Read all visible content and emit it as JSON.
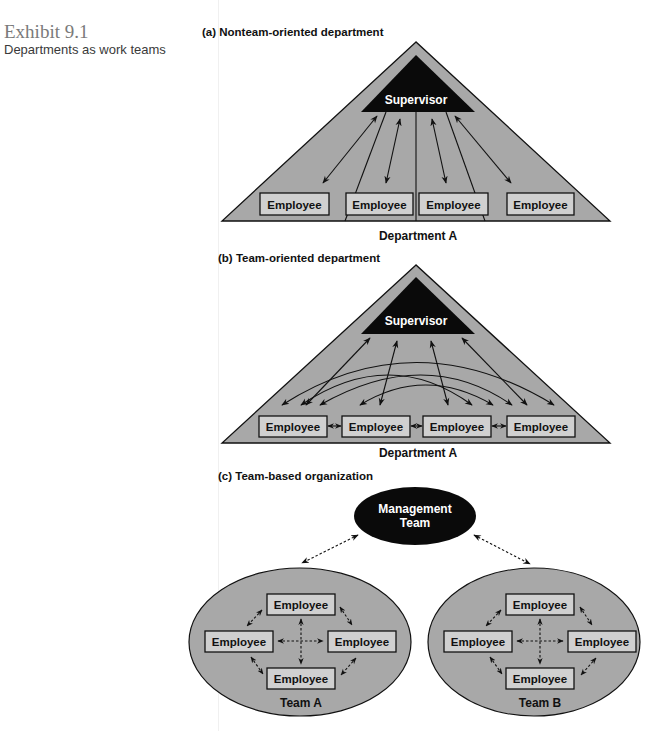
{
  "caption": {
    "exhibit_number": "Exhibit 9.1",
    "title": "Departments as work teams"
  },
  "colors": {
    "fill_gray": "#a8a8a8",
    "box_fill": "#d0d0d0",
    "dark": "#0a0a0a",
    "text": "#111111"
  },
  "panel_a": {
    "heading": "(a) Nonteam-oriented department",
    "supervisor": "Supervisor",
    "employees": [
      "Employee",
      "Employee",
      "Employee",
      "Employee"
    ],
    "department_label": "Department A"
  },
  "panel_b": {
    "heading": "(b) Team-oriented department",
    "supervisor": "Supervisor",
    "employees": [
      "Employee",
      "Employee",
      "Employee",
      "Employee"
    ],
    "department_label": "Department A"
  },
  "panel_c": {
    "heading": "(c) Team-based organization",
    "management_line1": "Management",
    "management_line2": "Team",
    "team_a": {
      "label": "Team A",
      "employees": [
        "Employee",
        "Employee",
        "Employee",
        "Employee"
      ]
    },
    "team_b": {
      "label": "Team B",
      "employees": [
        "Employee",
        "Employee",
        "Employee",
        "Employee"
      ]
    }
  }
}
